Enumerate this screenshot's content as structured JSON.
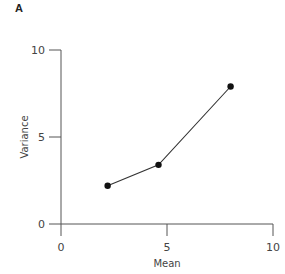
{
  "panel_label": "A",
  "chart_data": {
    "type": "line",
    "title": "",
    "xlabel": "Mean",
    "ylabel": "Variance",
    "xlim": [
      0,
      10
    ],
    "ylim": [
      0,
      10
    ],
    "x_ticks": [
      "0",
      "5",
      "10"
    ],
    "y_ticks": [
      "0",
      "5",
      "10"
    ],
    "grid": false,
    "legend": null,
    "series": [
      {
        "name": "",
        "x": [
          2.2,
          4.6,
          8.0
        ],
        "y": [
          2.2,
          3.4,
          7.9
        ],
        "marker": "filled-circle",
        "color": "#111111"
      }
    ]
  }
}
